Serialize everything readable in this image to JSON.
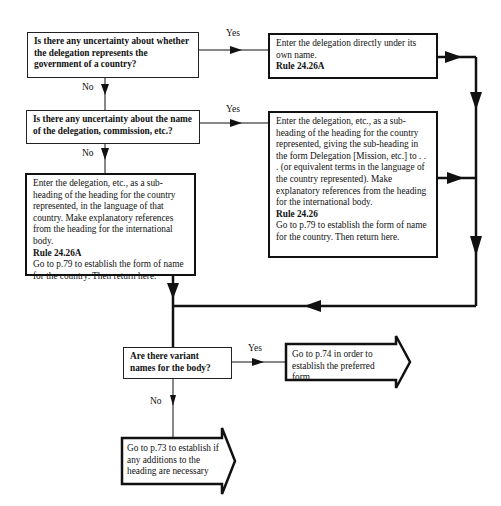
{
  "diagram": {
    "questions": [
      {
        "id": "q1",
        "text": "Is there any uncertainty about whether the delegation represents the government of a country?"
      },
      {
        "id": "q2",
        "text": "Is there any uncertainty about the name of the delegation, commission, etc.?"
      },
      {
        "id": "q3",
        "text": "Are there variant names for the body?"
      }
    ],
    "actions": [
      {
        "id": "a1",
        "text": "Enter the delegation directly under its own name.",
        "rule": "Rule 24.26A"
      },
      {
        "id": "a2",
        "text": "Enter the delegation, etc., as a sub-heading of the heading for the country represented, giving the sub-heading in the form Delegation [Mission, etc.] to . . . (or equivalent terms in the language of the country represented). Make explanatory references from the heading for the international body.",
        "rule": "Rule 24.26",
        "after": "Go to p.79 to establish the form of name for the country. Then return here."
      },
      {
        "id": "a3",
        "text": "Enter the delegation, etc., as a sub-heading of the heading for the country represented, in the language of that country. Make explanatory references from the heading for the international body.",
        "rule": "Rule 24.26A",
        "after": "Go to p.79 to establish the form of name for the country. Then return here."
      }
    ],
    "terminals": [
      {
        "id": "t1",
        "text": "Go to p.74 in order to establish the preferred form"
      },
      {
        "id": "t2",
        "text": "Go to p.73 to establish if any additions to the heading are necessary"
      }
    ],
    "edge_labels": {
      "yes": "Yes",
      "no": "No"
    }
  }
}
